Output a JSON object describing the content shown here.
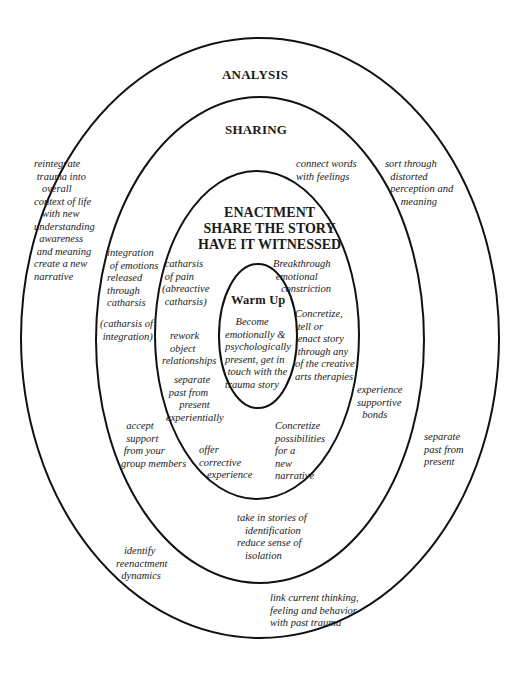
{
  "diagram": {
    "rings": [
      {
        "id": "analysis",
        "cx": 260,
        "cy": 338,
        "rx": 239,
        "ry": 300
      },
      {
        "id": "sharing",
        "cx": 260,
        "cy": 340,
        "rx": 164,
        "ry": 243
      },
      {
        "id": "enactment",
        "cx": 257,
        "cy": 335,
        "rx": 102,
        "ry": 164
      },
      {
        "id": "warm_up",
        "cx": 258,
        "cy": 336,
        "rx": 39,
        "ry": 72
      }
    ],
    "stroke_color": "#111111"
  },
  "analysis": {
    "title": "ANALYSIS",
    "notes": {
      "reintegrate": "reintegrate\n trauma into\n   overall\ncontext of life\n   with new\nunderstanding\n  awareness\n and meaning\ncreate a new\nnarrative",
      "sort_through": "sort through\n  distorted\n  perception and\n      meaning",
      "separate_past": "separate\npast from\npresent",
      "identify": "   identify\nreenactment\n  dynamics",
      "link_current": "link current thinking,\nfeeling and behavior\nwith past trauma"
    }
  },
  "sharing": {
    "title": "SHARING",
    "notes": {
      "connect_words": "connect words\nwith feelings",
      "integration": "integration\n of emotions\nreleased\nthrough\ncatharsis",
      "catharsis_integration": "(catharsis of\n integration)",
      "experience_bonds": "experience\nsupportive\n  bonds",
      "accept_support": "  accept\n  support\n from your\ngroup members",
      "take_in_stories": "take in stories of\n   identification\nreduce sense of\n   isolation"
    }
  },
  "enactment": {
    "title_line1": "ENACTMENT",
    "title_line2": "SHARE THE STORY",
    "title_line3": "HAVE IT WITNESSED",
    "notes": {
      "catharsis_pain": " catharsis\n of pain\n(abreactive\n catharsis)",
      "breakthrough": "Breakthrough\n emotional\n   constriction",
      "concretize_tell": "Concretize,\n tell or\n enact story\n through any\nof the creative\narts therapies",
      "rework": "   rework\n   object\nrelationships",
      "separate_exp": "   separate\n past from\n     present\nexperientially",
      "offer_corrective": "offer\ncorrective\n   experience",
      "concretize_possibilities": "Concretize\npossibilities\nfor a\nnew\nnarrative"
    }
  },
  "warm_up": {
    "title": "Warm Up",
    "note": "    Become\nemotionally &\npsychologically\npresent, get in\n touch with the\ntrauma story"
  }
}
